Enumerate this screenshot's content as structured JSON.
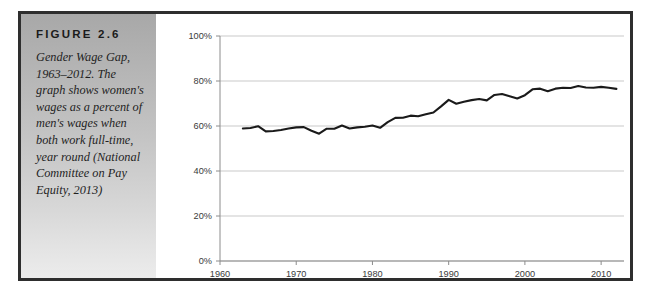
{
  "figure": {
    "label": "FIGURE 2.6",
    "caption": "Gender Wage Gap, 1963–2012. The graph shows women's wages as a percent of men's wages when both work full-time, year round (National Committee on Pay Equity, 2013)"
  },
  "colors": {
    "frame_border": "#2e2e2e",
    "panel_top": "#a8a8a8",
    "panel_bottom": "#ececec",
    "line": "#1a1a1a",
    "gridline": "#c9c9c9",
    "axis": "#8c8c8c",
    "tick_text": "#3a3a3a",
    "plot_background": "#ffffff"
  },
  "chart_data": {
    "type": "line",
    "title": "",
    "subtitle": "",
    "xlabel": "",
    "ylabel": "",
    "xlim": [
      1960,
      2013
    ],
    "ylim": [
      0,
      100
    ],
    "grid": true,
    "legend": false,
    "legend_position": "none",
    "x_ticks": [
      "1960",
      "1970",
      "1980",
      "1990",
      "2000",
      "2010"
    ],
    "x_tick_values": [
      1960,
      1970,
      1980,
      1990,
      2000,
      2010
    ],
    "y_ticks": [
      "0%",
      "20%",
      "40%",
      "60%",
      "80%",
      "100%"
    ],
    "y_tick_values": [
      0,
      20,
      40,
      60,
      80,
      100
    ],
    "series": [
      {
        "name": "Women's earnings as a percent of men's",
        "x": [
          1963,
          1964,
          1965,
          1966,
          1967,
          1968,
          1969,
          1970,
          1971,
          1972,
          1973,
          1974,
          1975,
          1976,
          1977,
          1978,
          1979,
          1980,
          1981,
          1982,
          1983,
          1984,
          1985,
          1986,
          1987,
          1988,
          1989,
          1990,
          1991,
          1992,
          1993,
          1994,
          1995,
          1996,
          1997,
          1998,
          1999,
          2000,
          2001,
          2002,
          2003,
          2004,
          2005,
          2006,
          2007,
          2008,
          2009,
          2010,
          2011,
          2012
        ],
        "values": [
          58.9,
          59.1,
          59.9,
          57.6,
          57.8,
          58.2,
          58.9,
          59.4,
          59.5,
          57.9,
          56.6,
          58.8,
          58.8,
          60.2,
          58.9,
          59.4,
          59.7,
          60.2,
          59.2,
          61.7,
          63.6,
          63.7,
          64.6,
          64.3,
          65.2,
          66.0,
          68.7,
          71.6,
          69.9,
          70.8,
          71.5,
          72.0,
          71.4,
          73.8,
          74.2,
          73.2,
          72.2,
          73.7,
          76.3,
          76.6,
          75.5,
          76.6,
          77.0,
          76.9,
          77.8,
          77.1,
          77.0,
          77.4,
          77.0,
          76.5
        ]
      }
    ]
  }
}
